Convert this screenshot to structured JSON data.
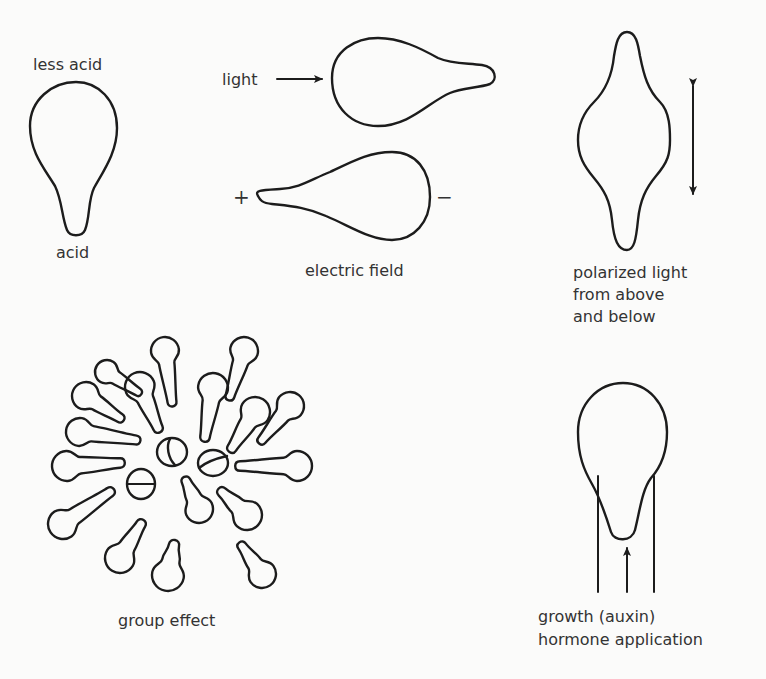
{
  "panels": {
    "acid": {
      "top_label": "less acid",
      "bottom_label": "acid"
    },
    "light": {
      "label": "light"
    },
    "electric_field": {
      "positive_sign": "+",
      "negative_sign": "−",
      "caption": "electric field"
    },
    "polarized_light": {
      "caption_lines": [
        "polarized light",
        "from above",
        "and below"
      ]
    },
    "group_effect": {
      "caption": "group effect",
      "outer_cell_count": 18,
      "central_dividing_cell_count": 3
    },
    "hormone": {
      "caption_lines": [
        "growth (auxin)",
        "hormone application"
      ]
    }
  },
  "colors": {
    "background": "#fbfbfa",
    "ink": "#1c1c1c",
    "text": "#333333"
  }
}
